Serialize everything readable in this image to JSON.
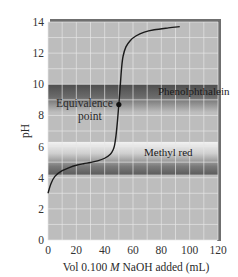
{
  "chart_data": {
    "type": "line",
    "title": "",
    "xlabel_parts": [
      "Vol 0.100 ",
      "M",
      " NaOH added (mL)"
    ],
    "xlabel": "Vol 0.100 M NaOH added (mL)",
    "ylabel": "pH",
    "xlim": [
      0,
      120
    ],
    "ylim": [
      0,
      14
    ],
    "x_ticks": [
      0,
      20,
      40,
      60,
      80,
      100,
      120
    ],
    "y_ticks": [
      0,
      2,
      4,
      6,
      8,
      10,
      12,
      14
    ],
    "grid": true,
    "series": [
      {
        "name": "Titration curve (weak acid with NaOH)",
        "x": [
          0,
          2,
          5,
          10,
          15,
          20,
          25,
          30,
          35,
          40,
          44,
          46,
          47,
          48,
          49,
          50,
          51,
          52,
          53,
          55,
          58,
          62,
          68,
          75,
          85,
          93
        ],
        "y": [
          3.0,
          3.6,
          4.1,
          4.45,
          4.65,
          4.8,
          4.9,
          4.98,
          5.08,
          5.25,
          5.5,
          5.8,
          6.1,
          6.7,
          7.6,
          8.7,
          9.9,
          11.1,
          11.8,
          12.4,
          12.8,
          13.1,
          13.35,
          13.5,
          13.62,
          13.7
        ]
      }
    ],
    "annotations": [
      {
        "text": "Equivalence point",
        "x": 50,
        "y": 8.7,
        "marker": "dot"
      }
    ],
    "indicator_bands": [
      {
        "name": "Phenolphthalein",
        "ymin": 8.2,
        "ymax": 10.0,
        "color": "#5a5a5a"
      },
      {
        "name": "Methyl red",
        "ymin": 4.2,
        "ymax": 6.3,
        "color": "#6a6a6a"
      }
    ]
  },
  "labels": {
    "equivalence_line1": "Equivalence",
    "equivalence_line2": "point",
    "phenolphthalein": "Phenolphthalein",
    "methyl_red": "Methyl red"
  },
  "colors": {
    "plot_bg": "#bdbdbd",
    "grid": "#e6e6e6",
    "curve": "#1a1a1a",
    "frame_shadow": "#6f6f6f"
  }
}
